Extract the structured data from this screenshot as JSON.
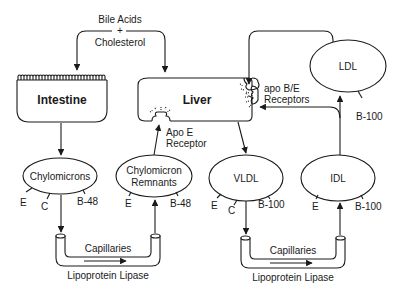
{
  "diagram": {
    "organs": {
      "intestine": "Intestine",
      "liver": "Liver"
    },
    "bile": {
      "line1": "Bile Acids",
      "plus": "+",
      "line2": "Cholesterol"
    },
    "receptors": {
      "apo_e_line1": "Apo E",
      "apo_e_line2": "Receptor",
      "apo_be_line1": "apo B/E",
      "apo_be_line2": "Receptors"
    },
    "particles": {
      "chylomicrons": {
        "label": "Chylomicrons",
        "apos": [
          "E",
          "C",
          "B-48"
        ]
      },
      "chylomicron_remnants": {
        "label_line1": "Chylomicron",
        "label_line2": "Remnants",
        "apos": [
          "E",
          "B-48"
        ]
      },
      "vldl": {
        "label": "VLDL",
        "apos": [
          "E",
          "C",
          "B-100"
        ]
      },
      "idl": {
        "label": "IDL",
        "apos": [
          "E",
          "B-100"
        ]
      },
      "ldl": {
        "label": "LDL",
        "apos": [
          "B-100"
        ]
      }
    },
    "capillaries": [
      {
        "label": "Capillaries",
        "enzyme": "Lipoprotein Lipase"
      },
      {
        "label": "Capillaries",
        "enzyme": "Lipoprotein Lipase"
      }
    ],
    "colors": {
      "ink": "#1a1a1a",
      "background": "#ffffff"
    }
  }
}
